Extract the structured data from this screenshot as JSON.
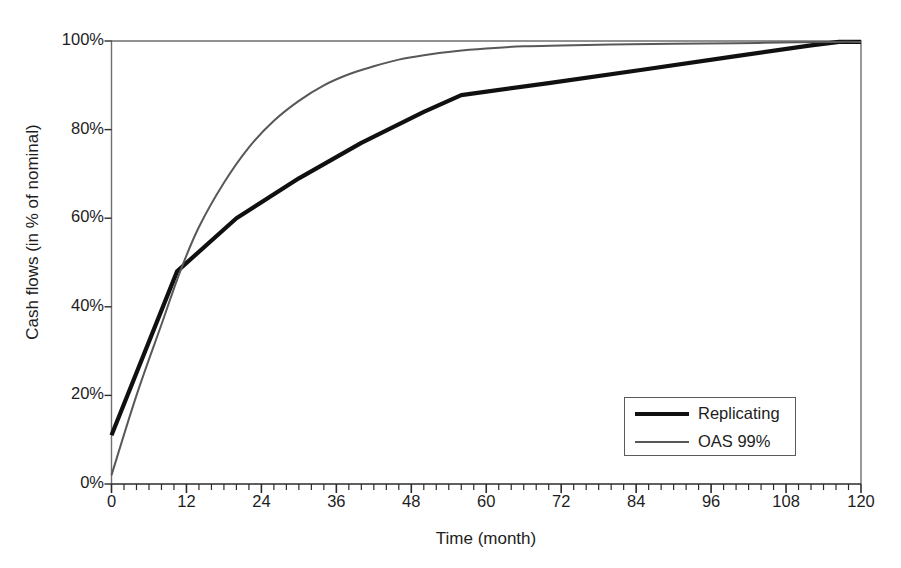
{
  "chart_data": {
    "type": "line",
    "title": "",
    "xlabel": "Time (month)",
    "ylabel": "Cash flows (in % of nominal)",
    "xlim": [
      0,
      120
    ],
    "ylim": [
      0,
      100
    ],
    "xticks": [
      "0",
      "12",
      "24",
      "36",
      "48",
      "60",
      "72",
      "84",
      "96",
      "108",
      "120"
    ],
    "xtick_values": [
      0,
      12,
      24,
      36,
      48,
      60,
      72,
      84,
      96,
      108,
      120
    ],
    "yticks": [
      "0%",
      "20%",
      "40%",
      "60%",
      "80%",
      "100%"
    ],
    "ytick_values": [
      0,
      20,
      40,
      60,
      80,
      100
    ],
    "minor_tick_interval_x": 2,
    "grid": false,
    "legend_position": "inside-lower-right",
    "series": [
      {
        "name": "Replicating",
        "color": "#101010",
        "width": 4.2,
        "points": [
          [
            0,
            11
          ],
          [
            10.5,
            48
          ],
          [
            20,
            60
          ],
          [
            30,
            69
          ],
          [
            40,
            77
          ],
          [
            50,
            84
          ],
          [
            56,
            87.8
          ],
          [
            70,
            90.5
          ],
          [
            85,
            93.5
          ],
          [
            100,
            96.6
          ],
          [
            112,
            99.0
          ],
          [
            116.5,
            99.8
          ],
          [
            120,
            99.8
          ]
        ]
      },
      {
        "name": "OAS 99%",
        "color": "#585858",
        "width": 2.0,
        "points": [
          [
            0,
            2
          ],
          [
            4,
            20
          ],
          [
            8,
            36
          ],
          [
            11,
            48
          ],
          [
            14,
            58
          ],
          [
            18,
            68
          ],
          [
            22,
            76
          ],
          [
            26,
            82
          ],
          [
            30,
            86.5
          ],
          [
            34,
            90
          ],
          [
            38,
            92.5
          ],
          [
            42,
            94.3
          ],
          [
            46,
            95.8
          ],
          [
            50,
            96.8
          ],
          [
            55,
            97.7
          ],
          [
            60,
            98.3
          ],
          [
            66,
            98.8
          ],
          [
            72,
            99.0
          ],
          [
            80,
            99.2
          ],
          [
            90,
            99.4
          ],
          [
            100,
            99.5
          ],
          [
            110,
            99.7
          ],
          [
            116,
            99.8
          ],
          [
            120,
            99.8
          ]
        ]
      }
    ]
  },
  "legend": {
    "entries": [
      {
        "label": "Replicating",
        "style": "thick"
      },
      {
        "label": "OAS 99%",
        "style": "thin"
      }
    ]
  },
  "top_artifact": {
    "text": ""
  },
  "colors": {
    "replicating": "#101010",
    "oas": "#585858",
    "axis": "#6f6f6f",
    "text": "#1d1d1d",
    "background": "#ffffff"
  }
}
